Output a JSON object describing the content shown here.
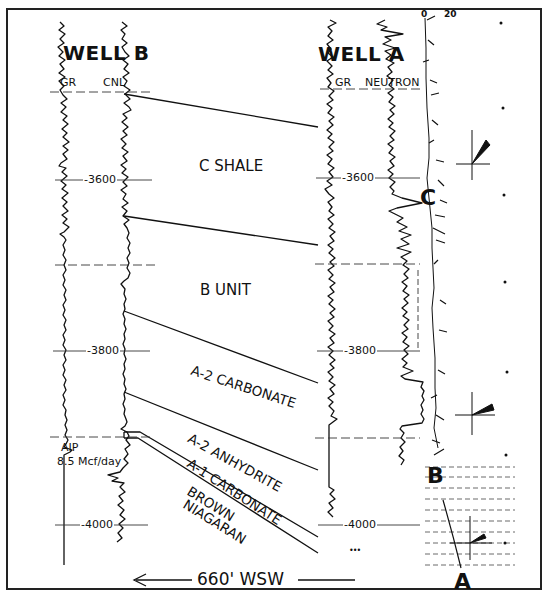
{
  "figure": {
    "type": "well-log cross section",
    "wells": [
      {
        "name": "WELL B",
        "curves": [
          "GR",
          "CNL"
        ]
      },
      {
        "name": "WELL A",
        "curves": [
          "GR",
          "NEUTRON"
        ]
      }
    ],
    "depth_markers": {
      "well_b": [
        "-3600",
        "-3800",
        "-4000"
      ],
      "well_a": [
        "-3600",
        "-3800",
        "-4000"
      ]
    },
    "units": [
      {
        "label": "C SHALE"
      },
      {
        "label": "B UNIT"
      },
      {
        "label": "A-2 CARBONATE"
      },
      {
        "label": "A-2 ANHYDRITE"
      },
      {
        "label": "A-1 CARBONATE"
      },
      {
        "label": "BROWN"
      },
      {
        "label": "NIAGARAN"
      }
    ],
    "annotation": {
      "line1": "AIP",
      "line2": "8.5 Mcf/day"
    },
    "distance": {
      "arrow": "left",
      "label": "660' WSW"
    },
    "dipmeter": {
      "scale_labels": [
        "0",
        "20"
      ],
      "zones": [
        "C",
        "B",
        "A"
      ]
    },
    "well_a_note": "•••"
  }
}
